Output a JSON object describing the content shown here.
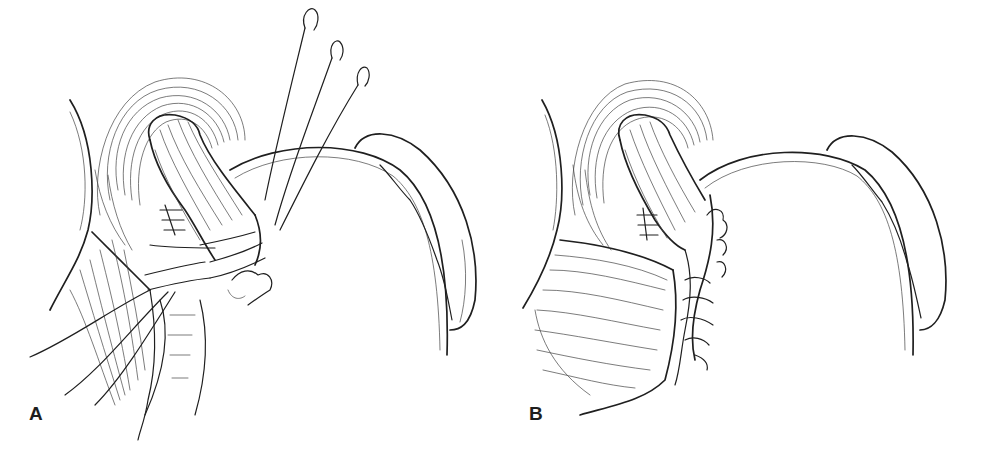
{
  "figure": {
    "panels": [
      {
        "label": "A",
        "description": "Sutures placed through stomach wall and esophagus with three curved needles"
      },
      {
        "label": "B",
        "description": "Completed fundoplication wrap with tied sutures"
      }
    ],
    "colors": {
      "ink": "#1f1f1f",
      "background": "#ffffff"
    }
  }
}
